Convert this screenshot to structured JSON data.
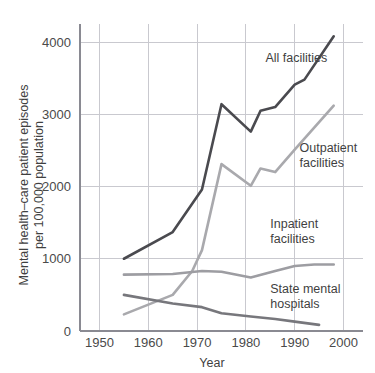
{
  "chart_data": {
    "type": "line",
    "title": "",
    "xlabel": "Year",
    "ylabel": "Mental health–care patient episodes per 100,000 population",
    "ylabel_line1": "Mental health–care patient episodes",
    "ylabel_line2": "per 100,000 population",
    "xlim": [
      1946,
      2004
    ],
    "ylim": [
      0,
      4250
    ],
    "xticks": [
      1950,
      1960,
      1970,
      1980,
      1990,
      2000
    ],
    "xtick_labels": [
      "1950",
      "1960",
      "1970",
      "1980",
      "1990",
      "2000"
    ],
    "yticks": [
      0,
      1000,
      2000,
      3000,
      4000
    ],
    "ytick_labels": [
      "0",
      "1000",
      "2000",
      "3000",
      "4000"
    ],
    "grid": true,
    "legend_position": "inline-annotations",
    "series": [
      {
        "name": "All facilities",
        "color": "#4a4a4f",
        "label_x": 1984,
        "label_y": 3720,
        "points": [
          {
            "x": 1955,
            "y": 1000
          },
          {
            "x": 1965,
            "y": 1370
          },
          {
            "x": 1971,
            "y": 1960
          },
          {
            "x": 1975,
            "y": 3140
          },
          {
            "x": 1981,
            "y": 2760
          },
          {
            "x": 1983,
            "y": 3050
          },
          {
            "x": 1986,
            "y": 3100
          },
          {
            "x": 1990,
            "y": 3410
          },
          {
            "x": 1992,
            "y": 3480
          },
          {
            "x": 1998,
            "y": 4080
          }
        ]
      },
      {
        "name": "Outpatient facilities",
        "color": "#a9a9ad",
        "label_x": 1991,
        "label_y": 2480,
        "label_line1": "Outpatient",
        "label_line2": "facilities",
        "points": [
          {
            "x": 1955,
            "y": 230
          },
          {
            "x": 1965,
            "y": 500
          },
          {
            "x": 1969,
            "y": 830
          },
          {
            "x": 1971,
            "y": 1120
          },
          {
            "x": 1975,
            "y": 2310
          },
          {
            "x": 1981,
            "y": 2010
          },
          {
            "x": 1983,
            "y": 2250
          },
          {
            "x": 1986,
            "y": 2200
          },
          {
            "x": 1990,
            "y": 2510
          },
          {
            "x": 1998,
            "y": 3120
          }
        ]
      },
      {
        "name": "Inpatient facilities",
        "color": "#9d9da2",
        "label_x": 1985,
        "label_y": 1420,
        "label_line1": "Inpatient",
        "label_line2": "facilities",
        "points": [
          {
            "x": 1955,
            "y": 780
          },
          {
            "x": 1965,
            "y": 790
          },
          {
            "x": 1971,
            "y": 830
          },
          {
            "x": 1975,
            "y": 820
          },
          {
            "x": 1981,
            "y": 740
          },
          {
            "x": 1986,
            "y": 830
          },
          {
            "x": 1990,
            "y": 900
          },
          {
            "x": 1994,
            "y": 920
          },
          {
            "x": 1998,
            "y": 920
          }
        ]
      },
      {
        "name": "State mental hospitals",
        "color": "#77777c",
        "label_x": 1985,
        "label_y": 520,
        "label_line1": "State mental",
        "label_line2": "hospitals",
        "points": [
          {
            "x": 1955,
            "y": 500
          },
          {
            "x": 1965,
            "y": 380
          },
          {
            "x": 1971,
            "y": 330
          },
          {
            "x": 1975,
            "y": 245
          },
          {
            "x": 1981,
            "y": 200
          },
          {
            "x": 1986,
            "y": 165
          },
          {
            "x": 1990,
            "y": 130
          },
          {
            "x": 1995,
            "y": 85
          }
        ]
      }
    ]
  }
}
